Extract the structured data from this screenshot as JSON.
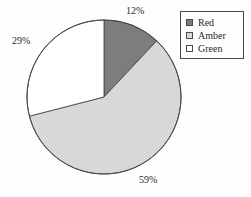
{
  "chart_data": {
    "type": "pie",
    "title": "",
    "categories": [
      "Red",
      "Amber",
      "Green"
    ],
    "values": [
      12,
      59,
      29
    ],
    "data_labels": [
      "12%",
      "59%",
      "29%"
    ],
    "units": "percent",
    "start_angle_deg": 0,
    "direction": "clockwise",
    "legend_position": "top-right",
    "grid": false,
    "colors": [
      "#7d7d7d",
      "#d8d8d8",
      "#ffffff"
    ],
    "slices": [
      {
        "name": "Red",
        "value": 12,
        "label": "12%",
        "color": "#7d7d7d",
        "sweep_deg": 43.2
      },
      {
        "name": "Amber",
        "value": 59,
        "label": "59%",
        "color": "#d8d8d8",
        "sweep_deg": 212.4
      },
      {
        "name": "Green",
        "value": 29,
        "label": "29%",
        "color": "#ffffff",
        "sweep_deg": 104.4
      }
    ]
  },
  "pie": {
    "outline_color": "#4a4a4a",
    "labels": {
      "red_pct": "12%",
      "amber_pct": "59%",
      "green_pct": "29%"
    }
  },
  "legend": {
    "border_color": "#4a4a4a",
    "items": [
      {
        "label": "Red",
        "color": "#7d7d7d"
      },
      {
        "label": "Amber",
        "color": "#d8d8d8"
      },
      {
        "label": "Green",
        "color": "#ffffff"
      }
    ]
  }
}
